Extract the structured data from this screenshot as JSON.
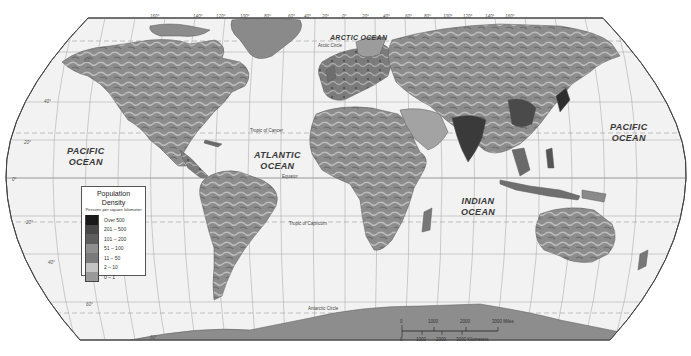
{
  "map": {
    "title": "World Population Density",
    "projection": "Robinson",
    "ocean_labels": [
      {
        "name": "PACIFIC OCEAN (west)",
        "line1": "PACIFIC",
        "line2": "OCEAN"
      },
      {
        "name": "ATLANTIC OCEAN",
        "line1": "ATLANTIC",
        "line2": "OCEAN"
      },
      {
        "name": "INDIAN OCEAN",
        "line1": "INDIAN",
        "line2": "OCEAN"
      },
      {
        "name": "PACIFIC OCEAN (east)",
        "line1": "PACIFIC",
        "line2": "OCEAN"
      },
      {
        "name": "ARCTIC OCEAN",
        "line1": "ARCTIC OCEAN",
        "line2": ""
      }
    ],
    "reference_lines": {
      "arctic_circle": "Arctic Circle",
      "tropic_of_cancer": "Tropic of Cancer",
      "equator": "Equator",
      "tropic_of_capricorn": "Tropic of Capricorn",
      "antarctic_circle": "Antarctic Circle"
    },
    "longitude_labels": [
      "160°",
      "140°",
      "120°",
      "100°",
      "80°",
      "60°",
      "40°",
      "20°",
      "0°",
      "20°",
      "40°",
      "60°",
      "80°",
      "100°",
      "120°",
      "140°",
      "160°"
    ],
    "latitude_labels": {
      "n60": "60°",
      "n40": "40°",
      "n20": "20°",
      "eq": "0°",
      "s20": "20°",
      "s40": "40°",
      "s60": "60°",
      "s80": "80°"
    },
    "colors": {
      "ocean": "#f2f2f2",
      "graticule": "#9a9a9a",
      "border": "#444444",
      "land_base": "#8c8c8c"
    }
  },
  "legend": {
    "title": "Population Density",
    "subtitle": "Persons per square kilometer",
    "items": [
      {
        "label": "Over 500",
        "color": "#1a1a1a"
      },
      {
        "label": "201 – 500",
        "color": "#474747"
      },
      {
        "label": "101 – 200",
        "color": "#5e5e5e"
      },
      {
        "label": "51 – 100",
        "color": "#8f8f8f"
      },
      {
        "label": "11 – 50",
        "color": "#7a7a7a"
      },
      {
        "label": "2 – 10",
        "color": "#c4c4c4"
      },
      {
        "label": "0 – 1",
        "color": "#999999"
      }
    ]
  },
  "scale_bar": {
    "miles_ticks": [
      "0",
      "1000",
      "2000",
      "3000 Miles"
    ],
    "km_ticks": [
      "0",
      "1000",
      "2000",
      "3000 Kilometers"
    ]
  }
}
